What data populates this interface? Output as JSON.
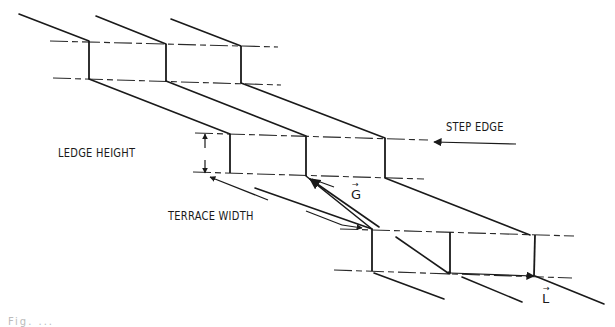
{
  "diagram": {
    "type": "terrace-step-surface",
    "labels": {
      "ledge_height": "LEDGE HEIGHT",
      "terrace_width": "TERRACE WIDTH",
      "step_edge": "STEP EDGE",
      "vector_g": "G",
      "vector_l": "L",
      "vector_mark": "→"
    },
    "caption_fragment": "Fig. ...",
    "colors": {
      "line": "#1a1a1a",
      "background": "#ffffff"
    },
    "tiers": [
      {
        "name": "upper",
        "riser_x": [
          88,
          166,
          241
        ],
        "top_y": [
          41,
          44,
          46
        ],
        "bottom_y": [
          79,
          81,
          83
        ]
      },
      {
        "name": "middle",
        "riser_x": [
          230,
          306,
          385
        ],
        "top_y": [
          134,
          136,
          138
        ],
        "bottom_y": [
          173,
          175,
          178
        ]
      },
      {
        "name": "lower",
        "riser_x": [
          372,
          450,
          535
        ],
        "top_y": [
          229,
          232,
          235
        ],
        "bottom_y": [
          270,
          273,
          276
        ]
      }
    ]
  }
}
